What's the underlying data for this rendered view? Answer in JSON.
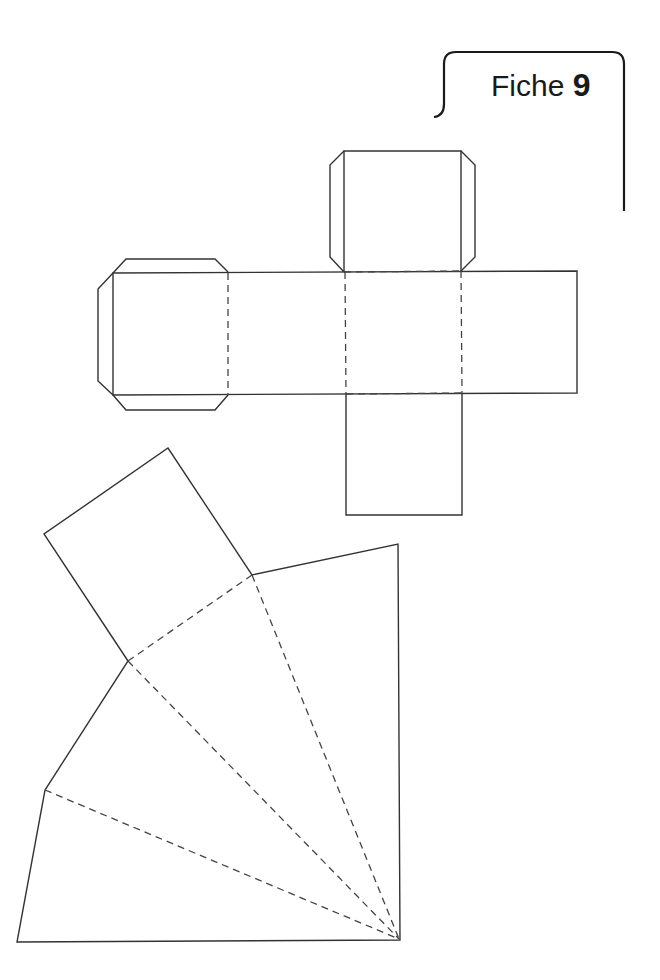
{
  "header": {
    "label": "Fiche",
    "number": "9"
  },
  "page_number": "",
  "figures": {
    "cube_net": {
      "description": "Cross-shaped net of a cube with glue tabs",
      "faces": 6,
      "tabs": 5,
      "line_color": "#333333"
    },
    "pyramid_net": {
      "description": "Fan-shaped net of a square pyramid: square base plus four triangular faces sharing an apex",
      "faces": 5,
      "line_color": "#333333"
    }
  },
  "legend": {
    "cut_line": "solid",
    "fold_line": "dashed"
  }
}
